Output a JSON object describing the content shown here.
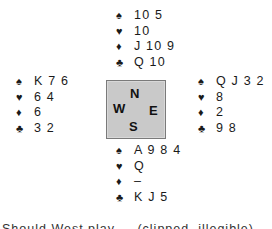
{
  "suits": {
    "spades": "♠",
    "hearts": "♥",
    "diamonds": "♦",
    "clubs": "♣"
  },
  "hands": {
    "north": {
      "spades": "10 5",
      "hearts": "10",
      "diamonds": "J 10 9",
      "clubs": "Q 10"
    },
    "west": {
      "spades": "K 7 6",
      "hearts": "6 4",
      "diamonds": "6",
      "clubs": "3 2"
    },
    "east": {
      "spades": "Q J 3 2",
      "hearts": "8",
      "diamonds": "2",
      "clubs": "9 8"
    },
    "south": {
      "spades": "A 9 8 4",
      "hearts": "Q",
      "diamonds": "–",
      "clubs": "K J 5"
    }
  },
  "compass": {
    "north": "N",
    "west": "W",
    "east": "E",
    "south": "S",
    "fill_color": "#c9c9c9",
    "border_color": "#7a7a7a"
  },
  "caption": {
    "text": "Should West play ... (clipped, illegible)"
  }
}
